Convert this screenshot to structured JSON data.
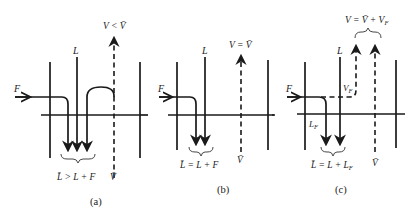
{
  "figure": {
    "panels": [
      {
        "id": "a",
        "caption": "(a)",
        "feed_label": "F",
        "liquid_label": "L",
        "vapor_top_label": "V < V̄",
        "vapor_bottom_label": "V̄",
        "liquid_bottom_label": "L̄ > L + F",
        "description": "Feed is liquid below bubble point; part of vapor condenses"
      },
      {
        "id": "b",
        "caption": "(b)",
        "feed_label": "F",
        "liquid_label": "L",
        "vapor_top_label": "V = V̄",
        "vapor_bottom_label": "V̄",
        "liquid_bottom_label": "L̄ = L + F",
        "description": "Feed is saturated liquid"
      },
      {
        "id": "c",
        "caption": "(c)",
        "feed_label": "F",
        "liquid_label": "L",
        "vapor_feed_label": "V_F",
        "liquid_feed_label": "L_F",
        "vapor_top_label": "V = V̄ + V_F",
        "vapor_bottom_label": "V̄",
        "liquid_bottom_label": "L̄ = L + L_F",
        "description": "Feed is partially vaporized"
      }
    ]
  }
}
